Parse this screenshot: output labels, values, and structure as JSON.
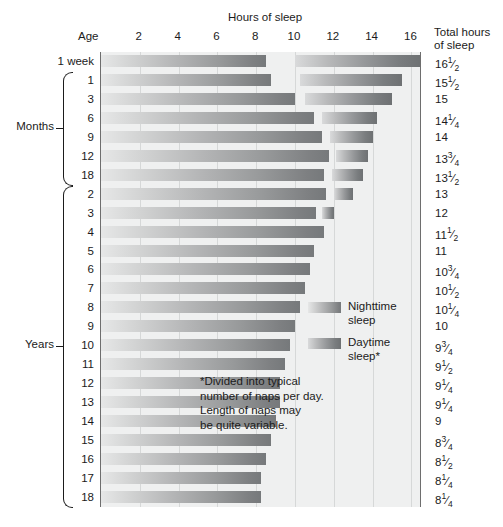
{
  "chart_data": {
    "type": "bar",
    "title": "Hours of sleep",
    "subtitle": "",
    "xlabel": "Hours of sleep",
    "ylabel": "Age",
    "xlim": [
      0,
      18
    ],
    "xticks": [
      2,
      4,
      6,
      8,
      10,
      12,
      14,
      16
    ],
    "grid": true,
    "orientation": "horizontal",
    "stacked_with_gap": true,
    "legend_position": "inside-right",
    "series": [
      {
        "name": "Nighttime sleep",
        "color": "#97999a"
      },
      {
        "name": "Daytime sleep*",
        "color": "#8a8c8e"
      }
    ],
    "categories": [
      "1 week",
      "1",
      "3",
      "6",
      "9",
      "12",
      "18",
      "2",
      "3",
      "4",
      "5",
      "6",
      "7",
      "8",
      "9",
      "10",
      "11",
      "12",
      "13",
      "14",
      "15",
      "16",
      "17",
      "18"
    ],
    "rows": [
      {
        "age": "1 week",
        "group": "",
        "night": 8.5,
        "day_start": 10.0,
        "day_end": 16.5,
        "total": "16",
        "total_frac": "1/2",
        "total_value": 16.5
      },
      {
        "age": "1",
        "group": "Months",
        "night": 8.75,
        "day_start": 10.25,
        "day_end": 15.5,
        "total": "15",
        "total_frac": "1/2",
        "total_value": 15.5
      },
      {
        "age": "3",
        "group": "Months",
        "night": 10.0,
        "day_start": 10.5,
        "day_end": 15.0,
        "total": "15",
        "total_frac": "",
        "total_value": 15.0
      },
      {
        "age": "6",
        "group": "Months",
        "night": 11.0,
        "day_start": 11.4,
        "day_end": 14.25,
        "total": "14",
        "total_frac": "1/4",
        "total_value": 14.25
      },
      {
        "age": "9",
        "group": "Months",
        "night": 11.4,
        "day_start": 11.8,
        "day_end": 14.0,
        "total": "14",
        "total_frac": "",
        "total_value": 14.0
      },
      {
        "age": "12",
        "group": "Months",
        "night": 11.75,
        "day_start": 12.1,
        "day_end": 13.75,
        "total": "13",
        "total_frac": "3/4",
        "total_value": 13.75
      },
      {
        "age": "18",
        "group": "Months",
        "night": 11.5,
        "day_start": 11.9,
        "day_end": 13.5,
        "total": "13",
        "total_frac": "1/2",
        "total_value": 13.5
      },
      {
        "age": "2",
        "group": "Years",
        "night": 11.6,
        "day_start": 12.0,
        "day_end": 13.0,
        "total": "13",
        "total_frac": "",
        "total_value": 13.0
      },
      {
        "age": "3",
        "group": "Years",
        "night": 11.1,
        "day_start": 11.4,
        "day_end": 12.0,
        "total": "12",
        "total_frac": "",
        "total_value": 12.0
      },
      {
        "age": "4",
        "group": "Years",
        "night": 11.5,
        "day_start": null,
        "day_end": null,
        "total": "11",
        "total_frac": "1/2",
        "total_value": 11.5
      },
      {
        "age": "5",
        "group": "Years",
        "night": 11.0,
        "day_start": null,
        "day_end": null,
        "total": "11",
        "total_frac": "",
        "total_value": 11.0
      },
      {
        "age": "6",
        "group": "Years",
        "night": 10.75,
        "day_start": null,
        "day_end": null,
        "total": "10",
        "total_frac": "3/4",
        "total_value": 10.75
      },
      {
        "age": "7",
        "group": "Years",
        "night": 10.5,
        "day_start": null,
        "day_end": null,
        "total": "10",
        "total_frac": "1/2",
        "total_value": 10.5
      },
      {
        "age": "8",
        "group": "Years",
        "night": 10.25,
        "day_start": null,
        "day_end": null,
        "total": "10",
        "total_frac": "1/4",
        "total_value": 10.25
      },
      {
        "age": "9",
        "group": "Years",
        "night": 10.0,
        "day_start": null,
        "day_end": null,
        "total": "10",
        "total_frac": "",
        "total_value": 10.0
      },
      {
        "age": "10",
        "group": "Years",
        "night": 9.75,
        "day_start": null,
        "day_end": null,
        "total": "9",
        "total_frac": "3/4",
        "total_value": 9.75
      },
      {
        "age": "11",
        "group": "Years",
        "night": 9.5,
        "day_start": null,
        "day_end": null,
        "total": "9",
        "total_frac": "1/2",
        "total_value": 9.5
      },
      {
        "age": "12",
        "group": "Years",
        "night": 9.25,
        "day_start": null,
        "day_end": null,
        "total": "9",
        "total_frac": "1/4",
        "total_value": 9.25
      },
      {
        "age": "13",
        "group": "Years",
        "night": 9.25,
        "day_start": null,
        "day_end": null,
        "total": "9",
        "total_frac": "1/4",
        "total_value": 9.25
      },
      {
        "age": "14",
        "group": "Years",
        "night": 9.0,
        "day_start": null,
        "day_end": null,
        "total": "9",
        "total_frac": "",
        "total_value": 9.0
      },
      {
        "age": "15",
        "group": "Years",
        "night": 8.75,
        "day_start": null,
        "day_end": null,
        "total": "8",
        "total_frac": "3/4",
        "total_value": 8.75
      },
      {
        "age": "16",
        "group": "Years",
        "night": 8.5,
        "day_start": null,
        "day_end": null,
        "total": "8",
        "total_frac": "1/2",
        "total_value": 8.5
      },
      {
        "age": "17",
        "group": "Years",
        "night": 8.25,
        "day_start": null,
        "day_end": null,
        "total": "8",
        "total_frac": "1/4",
        "total_value": 8.25
      },
      {
        "age": "18",
        "group": "Years",
        "night": 8.25,
        "day_start": null,
        "day_end": null,
        "total": "8",
        "total_frac": "1/4",
        "total_value": 8.25
      }
    ]
  },
  "headers": {
    "hours_of_sleep": "Hours of sleep",
    "age": "Age",
    "total_line1": "Total hours",
    "total_line2": "of sleep"
  },
  "groups": [
    {
      "label": "Months",
      "first_row": 1,
      "last_row": 6
    },
    {
      "label": "Years",
      "first_row": 7,
      "last_row": 23
    }
  ],
  "legend": {
    "items": [
      {
        "label": "Nighttime\nsleep",
        "name": "nighttime-sleep"
      },
      {
        "label": "Daytime\nsleep*",
        "name": "daytime-sleep"
      }
    ]
  },
  "footnote": {
    "text": "*Divided into typical\nnumber of naps per day.\nLength of naps may\nbe quite variable."
  },
  "colors": {
    "plot_background": "#eff0f0",
    "gridline": "#d6d8d8",
    "axis_rule": "#6e6e6e",
    "bar_night_light": "#e6e7e7",
    "bar_night_dark": "#76797b",
    "bar_day_light": "#d9dadb",
    "bar_day_dark": "#6e7173",
    "text": "#1b1b1b"
  }
}
